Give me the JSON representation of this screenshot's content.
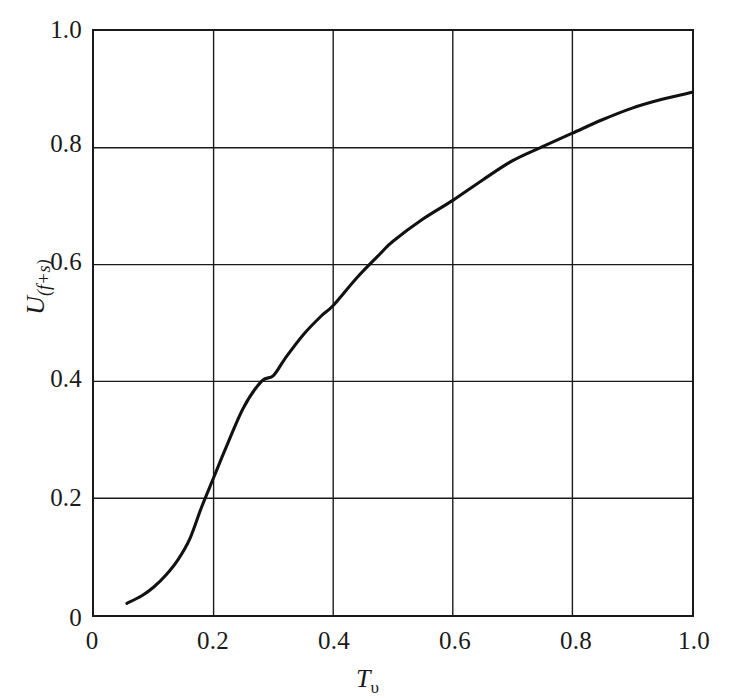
{
  "chart_data": {
    "type": "line",
    "title": "",
    "subtitle": "",
    "xlabel": "T_v",
    "xlabel_base": "T",
    "xlabel_sub": "υ",
    "ylabel": "U_(f+s)",
    "ylabel_base": "U",
    "ylabel_sub": "(f+s)",
    "xlim": [
      0,
      1.0
    ],
    "ylim": [
      0,
      1.0
    ],
    "grid": true,
    "legend": "none",
    "line_color": "#111111",
    "axis_color": "#1a1a1a",
    "xticks": [
      "0",
      "0.2",
      "0.4",
      "0.6",
      "0.8",
      "1.0"
    ],
    "xtick_values": [
      0,
      0.2,
      0.4,
      0.6,
      0.8,
      1.0
    ],
    "yticks": [
      "0",
      "0.2",
      "0.4",
      "0.6",
      "0.8",
      "1.0"
    ],
    "ytick_values": [
      0,
      0.2,
      0.4,
      0.6,
      0.8,
      1.0
    ],
    "series": [
      {
        "name": "U(f+s) vs Tv",
        "x": [
          0.055,
          0.08,
          0.1,
          0.12,
          0.14,
          0.16,
          0.18,
          0.2,
          0.22,
          0.25,
          0.28,
          0.3,
          0.32,
          0.35,
          0.38,
          0.4,
          0.44,
          0.48,
          0.5,
          0.55,
          0.6,
          0.65,
          0.7,
          0.75,
          0.8,
          0.85,
          0.9,
          0.95,
          1.0
        ],
        "y": [
          0.02,
          0.033,
          0.048,
          0.068,
          0.094,
          0.13,
          0.185,
          0.235,
          0.285,
          0.355,
          0.4,
          0.41,
          0.44,
          0.48,
          0.512,
          0.53,
          0.578,
          0.62,
          0.64,
          0.678,
          0.71,
          0.745,
          0.778,
          0.802,
          0.825,
          0.848,
          0.868,
          0.883,
          0.895
        ]
      }
    ]
  }
}
